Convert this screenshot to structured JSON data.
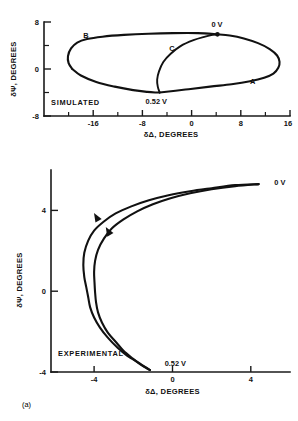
{
  "figure": {
    "caption": "(a)",
    "panels": [
      {
        "id": "simulated",
        "condition_label": "SIMULATED",
        "xlabel": "δΔ, DEGREES",
        "ylabel": "δΨ, DEGREES",
        "xticks": [
          "-16",
          "-8",
          "0",
          "8",
          "16"
        ],
        "yticks": [
          "8",
          "0",
          "-8"
        ],
        "annotations": [
          "0 V",
          "0.52 V",
          "A",
          "B",
          "C"
        ]
      },
      {
        "id": "experimental",
        "condition_label": "EXPERIMENTAL",
        "xlabel": "δΔ, DEGREES",
        "ylabel": "δΨ, DEGREES",
        "xticks": [
          "-4",
          "0",
          "4"
        ],
        "yticks": [
          "4",
          "0",
          "-4"
        ],
        "annotations": [
          "0 V",
          "0.52 V"
        ]
      }
    ]
  },
  "chart_data": [
    {
      "type": "line",
      "title": "SIMULATED",
      "xlabel": "δΔ, DEGREES",
      "ylabel": "δΨ, DEGREES",
      "xlim": [
        -24,
        16
      ],
      "ylim": [
        -8,
        8
      ],
      "xticks": [
        -16,
        -8,
        0,
        8,
        16
      ],
      "yticks": [
        -8,
        0,
        8
      ],
      "grid": false,
      "legend": "none",
      "annotations": [
        {
          "text": "0 V",
          "x": 4.2,
          "y": 5.9
        },
        {
          "text": "0.52 V",
          "x": -5.2,
          "y": -3.9
        },
        {
          "text": "A",
          "x": 9.5,
          "y": -2.6
        },
        {
          "text": "B",
          "x": -17.6,
          "y": 5.3
        },
        {
          "text": "C",
          "x": -3.2,
          "y": 3.0
        },
        {
          "text": "SIMULATED",
          "x": -21.0,
          "y": -5.4
        }
      ],
      "series": [
        {
          "name": "outer-loop-upper-branch-B",
          "comment": "from 0 V node leftward across top through B to far-left turn",
          "x": [
            4.2,
            1.0,
            -3.0,
            -7.0,
            -11.0,
            -14.5,
            -17.0,
            -18.6,
            -19.6,
            -20.1,
            -20.0,
            -19.4
          ],
          "y": [
            5.9,
            6.1,
            6.1,
            6.0,
            5.8,
            5.5,
            5.1,
            4.5,
            3.5,
            2.2,
            1.0,
            0.0
          ]
        },
        {
          "name": "outer-loop-lower-branch-to-0.52V",
          "comment": "far-left turn descending right to the 0.52 V node",
          "x": [
            -19.4,
            -18.0,
            -15.5,
            -12.5,
            -9.5,
            -7.2,
            -5.8,
            -5.2
          ],
          "y": [
            0.0,
            -1.1,
            -2.2,
            -3.0,
            -3.6,
            -3.9,
            -4.0,
            -4.0
          ]
        },
        {
          "name": "outer-loop-branch-A",
          "comment": "from 0.52 V node rightward through A to far-right turn and back to 0 V",
          "x": [
            -5.2,
            -1.0,
            3.0,
            6.5,
            9.5,
            11.8,
            13.3,
            14.1,
            14.3,
            13.9,
            12.7,
            10.8,
            8.5,
            6.2,
            4.2
          ],
          "y": [
            -4.0,
            -3.5,
            -3.0,
            -2.6,
            -2.1,
            -1.5,
            -0.8,
            0.2,
            1.2,
            2.3,
            3.4,
            4.4,
            5.2,
            5.7,
            5.9
          ]
        },
        {
          "name": "inner-branch-C",
          "comment": "inner trajectory from 0.52 V node rising and bending right to 0 V node",
          "x": [
            -5.2,
            -5.5,
            -5.6,
            -5.3,
            -4.6,
            -3.4,
            -1.8,
            0.3,
            2.2,
            3.4,
            4.2
          ],
          "y": [
            -4.0,
            -3.0,
            -1.8,
            -0.4,
            1.2,
            2.6,
            3.9,
            4.9,
            5.5,
            5.8,
            5.9
          ]
        }
      ]
    },
    {
      "type": "line",
      "title": "EXPERIMENTAL",
      "xlabel": "δΔ, DEGREES",
      "ylabel": "δΨ, DEGREES",
      "xlim": [
        -6.2,
        6.0
      ],
      "ylim": [
        -4,
        6.0
      ],
      "xticks": [
        -4,
        0,
        4
      ],
      "yticks": [
        -4,
        0,
        4
      ],
      "grid": false,
      "legend": "none",
      "annotations": [
        {
          "text": "0 V",
          "x": 5.1,
          "y": 5.4
        },
        {
          "text": "0.52 V",
          "x": -0.5,
          "y": -3.6
        },
        {
          "text": "EXPERIMENTAL",
          "x": -5.4,
          "y": -2.9
        }
      ],
      "arrows": [
        {
          "x": -3.9,
          "y": 3.7,
          "direction": "up-left"
        },
        {
          "x": -3.3,
          "y": 3.0,
          "direction": "up-left"
        }
      ],
      "series": [
        {
          "name": "forward-sweep",
          "comment": "outer strand: from 0 V at upper right, hooking left and down to 0.52 V",
          "x": [
            4.4,
            3.2,
            2.0,
            0.9,
            -0.2,
            -1.2,
            -2.1,
            -2.9,
            -3.5,
            -4.0,
            -4.3,
            -4.5,
            -4.55,
            -4.5,
            -4.4,
            -4.3,
            -4.2,
            -4.0,
            -3.7,
            -3.3,
            -2.8,
            -2.3,
            -1.8,
            -1.4,
            -1.15
          ],
          "y": [
            5.3,
            5.25,
            5.1,
            4.95,
            4.75,
            4.5,
            4.2,
            3.85,
            3.45,
            3.0,
            2.5,
            1.9,
            1.3,
            0.7,
            0.2,
            -0.3,
            -0.8,
            -1.3,
            -1.8,
            -2.3,
            -2.8,
            -3.2,
            -3.5,
            -3.75,
            -3.9
          ]
        },
        {
          "name": "reverse-sweep",
          "comment": "inner strand: returning path, slightly right of forward strand in the upper bend",
          "x": [
            4.4,
            3.2,
            2.0,
            0.9,
            -0.1,
            -1.0,
            -1.8,
            -2.5,
            -3.1,
            -3.5,
            -3.8,
            -3.95,
            -4.0,
            -3.98,
            -3.95,
            -3.9,
            -3.8,
            -3.6,
            -3.3,
            -2.9,
            -2.5,
            -2.0,
            -1.6,
            -1.25,
            -1.15
          ],
          "y": [
            5.3,
            5.2,
            5.05,
            4.85,
            4.6,
            4.3,
            3.95,
            3.55,
            3.1,
            2.6,
            2.05,
            1.5,
            0.95,
            0.45,
            -0.05,
            -0.55,
            -1.05,
            -1.55,
            -2.05,
            -2.5,
            -2.95,
            -3.35,
            -3.65,
            -3.85,
            -3.9
          ]
        }
      ]
    }
  ]
}
